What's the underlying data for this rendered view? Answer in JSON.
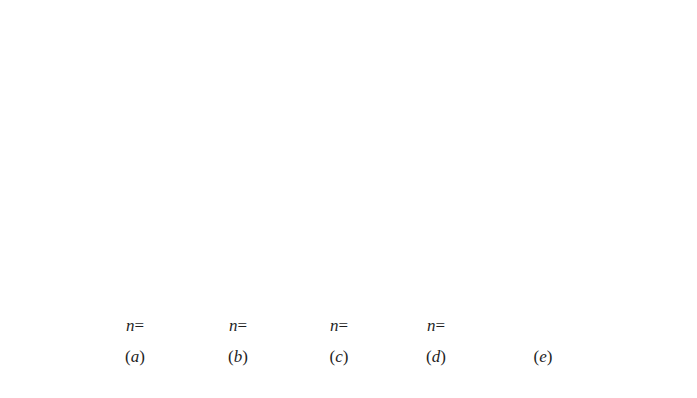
{
  "ground": {
    "label": "开挖面或地面",
    "y": 51,
    "x_start": 35,
    "x_end": 665
  },
  "axis": {
    "label": "Z",
    "x": 53,
    "y_start": 51,
    "y_end": 142
  },
  "diagram_geometry": {
    "top_y": 51,
    "bottom_y": 301,
    "hatch_count": 17
  },
  "panels": [
    {
      "id": "a",
      "n_label": "n=0",
      "n_value": "0",
      "caption": "(a)",
      "shape": "rectangle",
      "left_x": 108,
      "bottom_width": 55,
      "label_x": 135
    },
    {
      "id": "b",
      "n_label": "n=0.5",
      "n_value": "0.5",
      "caption": "(b)",
      "shape": "convex-curve",
      "left_x": 211,
      "bottom_width": 55,
      "label_x": 238
    },
    {
      "id": "c",
      "n_label": "n=1",
      "n_value": "1",
      "caption": "(c)",
      "shape": "triangle",
      "left_x": 310,
      "bottom_width": 57,
      "label_x": 339
    },
    {
      "id": "d",
      "n_label": "n=2",
      "n_value": "2",
      "caption": "(d)",
      "shape": "concave-curve",
      "left_x": 412,
      "bottom_width": 51,
      "label_x": 436
    },
    {
      "id": "e",
      "n_label": "",
      "n_value": "",
      "caption": "(e)",
      "shape": "trapezoid-then-rectangle",
      "left_x": 509,
      "bottom_width": 58,
      "break_y": 146,
      "label_x": 543
    }
  ],
  "colors": {
    "line": "#1a1a1a",
    "background": "#ffffff"
  }
}
